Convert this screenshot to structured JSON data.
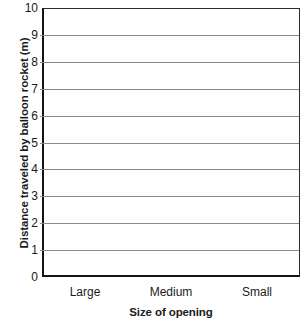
{
  "chart_data": {
    "type": "bar",
    "title": "",
    "xlabel": "Size of opening",
    "ylabel": "Distance traveled by balloon rocket (m)",
    "categories": [
      "Large",
      "Medium",
      "Small"
    ],
    "values": [
      null,
      null,
      null
    ],
    "series": [],
    "ylim": [
      0,
      10
    ],
    "y_ticks": [
      0,
      1,
      2,
      3,
      4,
      5,
      6,
      7,
      8,
      9,
      10
    ],
    "y_tick_labels": [
      "0",
      "1",
      "2",
      "3",
      "4",
      "5",
      "6",
      "7",
      "8",
      "9",
      "10"
    ],
    "grid": "horizontal",
    "legend": "none",
    "annotations": [],
    "note": "Blank grid template - no data plotted in the axes area"
  },
  "axes": {
    "y_title": "Distance traveled by balloon rocket (m)",
    "x_title": "Size of opening"
  },
  "colors": {
    "gridline": "#8c8c8c",
    "axis": "#151515",
    "border": "#2b2b2b",
    "text": "#1a1a1a",
    "plot_background": "#ffffff"
  }
}
